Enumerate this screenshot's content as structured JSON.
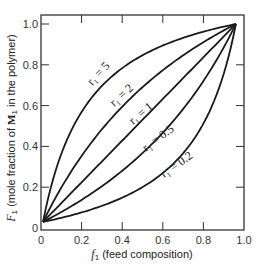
{
  "chart_data": {
    "type": "line",
    "title": "",
    "xlabel": "f1 (feed composition)",
    "ylabel": "F1 (mole fraction of M1 in the polymer)",
    "xlabel_parts": {
      "var": "f",
      "sub": "1",
      "rest": " (feed composition)"
    },
    "ylabel_parts": {
      "var": "F",
      "sub": "1",
      "rest_a": " (mole fraction of ",
      "bold_var": "M",
      "bold_sub": "1",
      "rest_b": " in the polymer)"
    },
    "xlim": [
      0,
      1.0
    ],
    "ylim": [
      0,
      1.0
    ],
    "xticks": [
      0,
      0.2,
      0.4,
      0.6,
      0.8,
      1.0
    ],
    "xtick_labels": [
      "0",
      "0.2",
      "0.4",
      "0.6",
      "0.8",
      "1.0"
    ],
    "yticks": [
      0,
      0.2,
      0.4,
      0.6,
      0.8,
      1.0
    ],
    "ytick_labels": [
      "0",
      "0.2",
      "0.4",
      "0.6",
      "0.8",
      "1.0"
    ],
    "grid": false,
    "legend": "inline curve labels",
    "x": [
      0,
      0.1,
      0.2,
      0.3,
      0.4,
      0.5,
      0.6,
      0.7,
      0.8,
      0.9,
      1.0
    ],
    "series": [
      {
        "name": "r1 = 5",
        "r1": 5,
        "label_text": "r₁ = 5",
        "values": [
          0,
          0.36,
          0.56,
          0.68,
          0.77,
          0.83,
          0.88,
          0.92,
          0.95,
          0.98,
          1.0
        ]
      },
      {
        "name": "r1 = 2",
        "r1": 2,
        "label_text": "r₁ = 2",
        "values": [
          0,
          0.18,
          0.33,
          0.46,
          0.57,
          0.67,
          0.75,
          0.82,
          0.89,
          0.95,
          1.0
        ]
      },
      {
        "name": "r1 = 1",
        "r1": 1,
        "label_text": "r₁ = 1",
        "values": [
          0,
          0.1,
          0.2,
          0.3,
          0.4,
          0.5,
          0.6,
          0.7,
          0.8,
          0.9,
          1.0
        ]
      },
      {
        "name": "r1 = 0.5",
        "r1": 0.5,
        "label_text": "r₁ = 0.5",
        "values": [
          0,
          0.05,
          0.11,
          0.18,
          0.25,
          0.33,
          0.43,
          0.54,
          0.67,
          0.82,
          1.0
        ]
      },
      {
        "name": "r1 = 0.2",
        "r1": 0.2,
        "label_text": "r₁ = 0.2",
        "values": [
          0,
          0.02,
          0.05,
          0.08,
          0.12,
          0.17,
          0.23,
          0.32,
          0.44,
          0.64,
          1.0
        ]
      }
    ],
    "annotations": [
      "r₁ = 5",
      "r₁ = 2",
      "r₁ = 1",
      "r₁ = 0.5",
      "r₁ = 0.2"
    ]
  },
  "style": {
    "line_color": "#1a1a1a",
    "frame_color": "#333333",
    "background": "#ffffff"
  }
}
